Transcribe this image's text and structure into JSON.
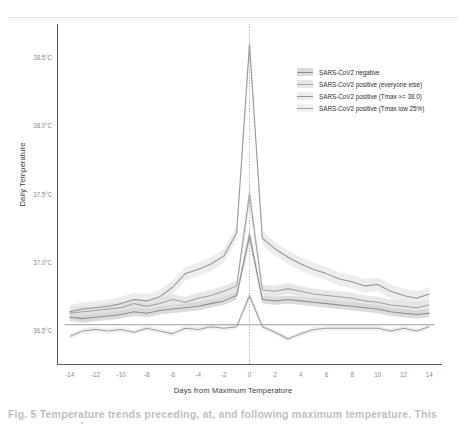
{
  "figure": {
    "caption": "Fig. 5 Temperature trends preceding, at, and following maximum temperature. This was our sample"
  },
  "chart_data": {
    "type": "line",
    "title": "",
    "xlabel": "Days from Maximum Temperature",
    "ylabel": "Daily Temperature",
    "xlim": [
      -15,
      15
    ],
    "ylim": [
      36.25,
      38.75
    ],
    "xticks": [
      -14,
      -12,
      -10,
      -8,
      -6,
      -4,
      -2,
      0,
      2,
      4,
      6,
      8,
      10,
      12,
      14
    ],
    "xtick_labels": [
      "-14",
      "-12",
      "-10",
      "-8",
      "-6",
      "-4",
      "-2",
      "0",
      "2",
      "4",
      "6",
      "8",
      "10",
      "12",
      "14"
    ],
    "yticks": [
      36.5,
      37.0,
      37.5,
      38.0,
      38.5
    ],
    "ytick_labels": [
      "36.5°C",
      "37.0°C",
      "37.5°C",
      "38.0°C",
      "38.5°C"
    ],
    "grid": false,
    "legend_position": "top-right",
    "reference_line": {
      "x": 0,
      "style": "dotted",
      "color": "#9a9a9a"
    },
    "x": [
      -14,
      -13,
      -12,
      -11,
      -10,
      -9,
      -8,
      -7,
      -6,
      -5,
      -4,
      -3,
      -2,
      -1,
      0,
      1,
      2,
      3,
      4,
      5,
      6,
      7,
      8,
      9,
      10,
      11,
      12,
      13,
      14
    ],
    "series": [
      {
        "name": "SARS-CoV2 negative",
        "color": "#8c8c8c",
        "band_color": "#bdbdbd",
        "values": [
          36.6,
          36.59,
          36.6,
          36.61,
          36.62,
          36.64,
          36.63,
          36.65,
          36.66,
          36.67,
          36.68,
          36.7,
          36.72,
          36.76,
          37.2,
          36.73,
          36.72,
          36.73,
          36.72,
          36.71,
          36.7,
          36.69,
          36.68,
          36.67,
          36.66,
          36.64,
          36.63,
          36.62,
          36.63
        ],
        "band_lower": [
          36.57,
          36.56,
          36.57,
          36.58,
          36.59,
          36.61,
          36.6,
          36.62,
          36.63,
          36.64,
          36.65,
          36.67,
          36.69,
          36.73,
          37.15,
          36.7,
          36.69,
          36.7,
          36.69,
          36.68,
          36.67,
          36.66,
          36.65,
          36.64,
          36.63,
          36.61,
          36.6,
          36.59,
          36.6
        ],
        "band_upper": [
          36.63,
          36.62,
          36.63,
          36.64,
          36.65,
          36.67,
          36.66,
          36.68,
          36.69,
          36.7,
          36.71,
          36.73,
          36.75,
          36.79,
          37.25,
          36.76,
          36.75,
          36.76,
          36.75,
          36.74,
          36.73,
          36.72,
          36.71,
          36.7,
          36.69,
          36.67,
          36.66,
          36.65,
          36.66
        ]
      },
      {
        "name": "SARS-CoV2 positive (everyone else)",
        "color": "#a0a0a0",
        "band_color": "#d4d4d4",
        "values": [
          36.63,
          36.64,
          36.65,
          36.66,
          36.67,
          36.7,
          36.68,
          36.7,
          36.73,
          36.71,
          36.74,
          36.76,
          36.79,
          36.83,
          37.5,
          36.8,
          36.79,
          36.81,
          36.79,
          36.77,
          36.76,
          36.75,
          36.74,
          36.72,
          36.71,
          36.69,
          36.68,
          36.67,
          36.69
        ],
        "band_lower": [
          36.59,
          36.6,
          36.61,
          36.62,
          36.63,
          36.66,
          36.64,
          36.66,
          36.69,
          36.67,
          36.7,
          36.72,
          36.75,
          36.79,
          37.42,
          36.76,
          36.75,
          36.77,
          36.75,
          36.73,
          36.72,
          36.71,
          36.7,
          36.68,
          36.67,
          36.65,
          36.64,
          36.63,
          36.65
        ],
        "band_upper": [
          36.67,
          36.68,
          36.69,
          36.7,
          36.71,
          36.74,
          36.72,
          36.74,
          36.77,
          36.75,
          36.78,
          36.8,
          36.83,
          36.87,
          37.58,
          36.84,
          36.83,
          36.85,
          36.83,
          36.81,
          36.8,
          36.79,
          36.78,
          36.76,
          36.75,
          36.73,
          36.72,
          36.71,
          36.73
        ]
      },
      {
        "name": "SARS-CoV2 positive (Tmax >= 38.0)",
        "color": "#949494",
        "band_color": "#dedede",
        "values": [
          36.64,
          36.66,
          36.67,
          36.68,
          36.7,
          36.73,
          36.72,
          36.75,
          36.82,
          36.92,
          36.95,
          36.99,
          37.05,
          37.22,
          38.6,
          37.18,
          37.1,
          37.04,
          36.99,
          36.95,
          36.92,
          36.88,
          36.86,
          36.83,
          36.84,
          36.79,
          36.76,
          36.74,
          36.77
        ],
        "band_lower": [
          36.59,
          36.61,
          36.62,
          36.63,
          36.65,
          36.68,
          36.67,
          36.7,
          36.77,
          36.87,
          36.9,
          36.94,
          37.0,
          37.17,
          38.54,
          37.13,
          37.05,
          36.99,
          36.94,
          36.9,
          36.87,
          36.83,
          36.81,
          36.78,
          36.79,
          36.74,
          36.71,
          36.69,
          36.72
        ],
        "band_upper": [
          36.69,
          36.71,
          36.72,
          36.73,
          36.75,
          36.78,
          36.77,
          36.8,
          36.87,
          36.97,
          37.0,
          37.04,
          37.1,
          37.27,
          38.66,
          37.23,
          37.15,
          37.09,
          37.04,
          37.0,
          36.97,
          36.93,
          36.91,
          36.88,
          36.89,
          36.84,
          36.81,
          36.79,
          36.82
        ]
      },
      {
        "name": "SARS-CoV2 positive (Tmax low 25%)",
        "color": "#9e9e9e",
        "band_color": "#e6e6e6",
        "values": [
          36.46,
          36.5,
          36.51,
          36.5,
          36.51,
          36.49,
          36.52,
          36.5,
          36.48,
          36.52,
          36.51,
          36.53,
          36.52,
          36.53,
          36.76,
          36.53,
          36.49,
          36.44,
          36.48,
          36.51,
          36.52,
          36.52,
          36.52,
          36.52,
          36.52,
          36.5,
          36.52,
          36.5,
          36.53
        ],
        "band_lower": [
          36.44,
          36.48,
          36.49,
          36.48,
          36.49,
          36.47,
          36.5,
          36.48,
          36.46,
          36.5,
          36.49,
          36.51,
          36.5,
          36.51,
          36.73,
          36.51,
          36.47,
          36.42,
          36.46,
          36.49,
          36.5,
          36.5,
          36.5,
          36.5,
          36.5,
          36.48,
          36.5,
          36.48,
          36.51
        ],
        "band_upper": [
          36.48,
          36.52,
          36.53,
          36.52,
          36.53,
          36.51,
          36.54,
          36.52,
          36.5,
          36.54,
          36.53,
          36.55,
          36.54,
          36.55,
          36.79,
          36.55,
          36.51,
          36.46,
          36.5,
          36.53,
          36.54,
          36.54,
          36.54,
          36.54,
          36.54,
          36.52,
          36.54,
          36.52,
          36.55
        ]
      }
    ],
    "flat_reference": {
      "name": "baseline-flat-line",
      "color": "#8f8f8f",
      "y": 36.545
    }
  }
}
